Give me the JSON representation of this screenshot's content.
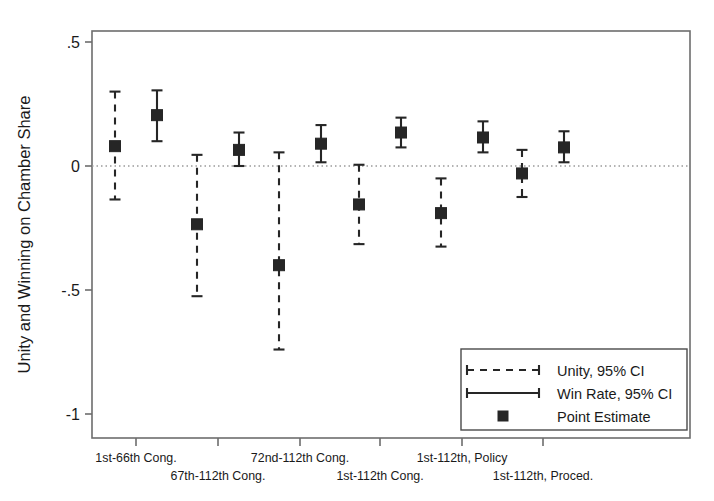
{
  "chart_data": {
    "type": "scatter",
    "title": "",
    "subtitle": "",
    "xlabel": "",
    "ylabel": "Unity and Winning on Chamber Share",
    "ylim": [
      -1.0,
      0.5
    ],
    "yticks": [
      0.5,
      0,
      -0.5,
      -1
    ],
    "ytick_labels": [
      ".5",
      "0",
      "-.5",
      "-1"
    ],
    "grid": false,
    "zero_reference_line": 0,
    "legend_position": "bottom-right",
    "categories": [
      "1st-66th Cong.",
      "67th-112th Cong.",
      "72nd-112th Cong.",
      "1st-112th Cong.",
      "1st-112th, Policy",
      "1st-112th, Proced."
    ],
    "series": [
      {
        "name": "Unity, 95% CI",
        "style": "dashed",
        "values": [
          0.08,
          -0.235,
          -0.4,
          -0.155,
          -0.19,
          -0.03
        ],
        "ci_low": [
          -0.135,
          -0.525,
          -0.74,
          -0.315,
          -0.325,
          -0.125
        ],
        "ci_high": [
          0.3,
          0.045,
          0.055,
          0.005,
          -0.05,
          0.065
        ]
      },
      {
        "name": "Win Rate, 95% CI",
        "style": "solid",
        "values": [
          0.205,
          0.065,
          0.09,
          0.135,
          0.115,
          0.075
        ],
        "ci_low": [
          0.1,
          0.0,
          0.015,
          0.075,
          0.055,
          0.015
        ],
        "ci_high": [
          0.305,
          0.135,
          0.165,
          0.195,
          0.18,
          0.14
        ]
      }
    ]
  },
  "legend": {
    "items": [
      {
        "label": "Unity, 95% CI",
        "style": "dashed"
      },
      {
        "label": "Win Rate, 95% CI",
        "style": "solid"
      },
      {
        "label": "Point Estimate",
        "style": "marker"
      }
    ]
  },
  "axes": {
    "y_axis_label": "Unity and Winning on Chamber Share",
    "y_tick_labels": [
      ".5",
      "0",
      "-.5",
      "-1"
    ],
    "x_tick_labels": [
      "1st-66th Cong.",
      "67th-112th Cong.",
      "72nd-112th Cong.",
      "1st-112th Cong.",
      "1st-112th, Policy",
      "1st-112th, Proced."
    ]
  },
  "colors": {
    "marker": "#262626",
    "axis": "#6d6d6d",
    "zero_line": "#9a9a9a",
    "background": "#ffffff"
  }
}
